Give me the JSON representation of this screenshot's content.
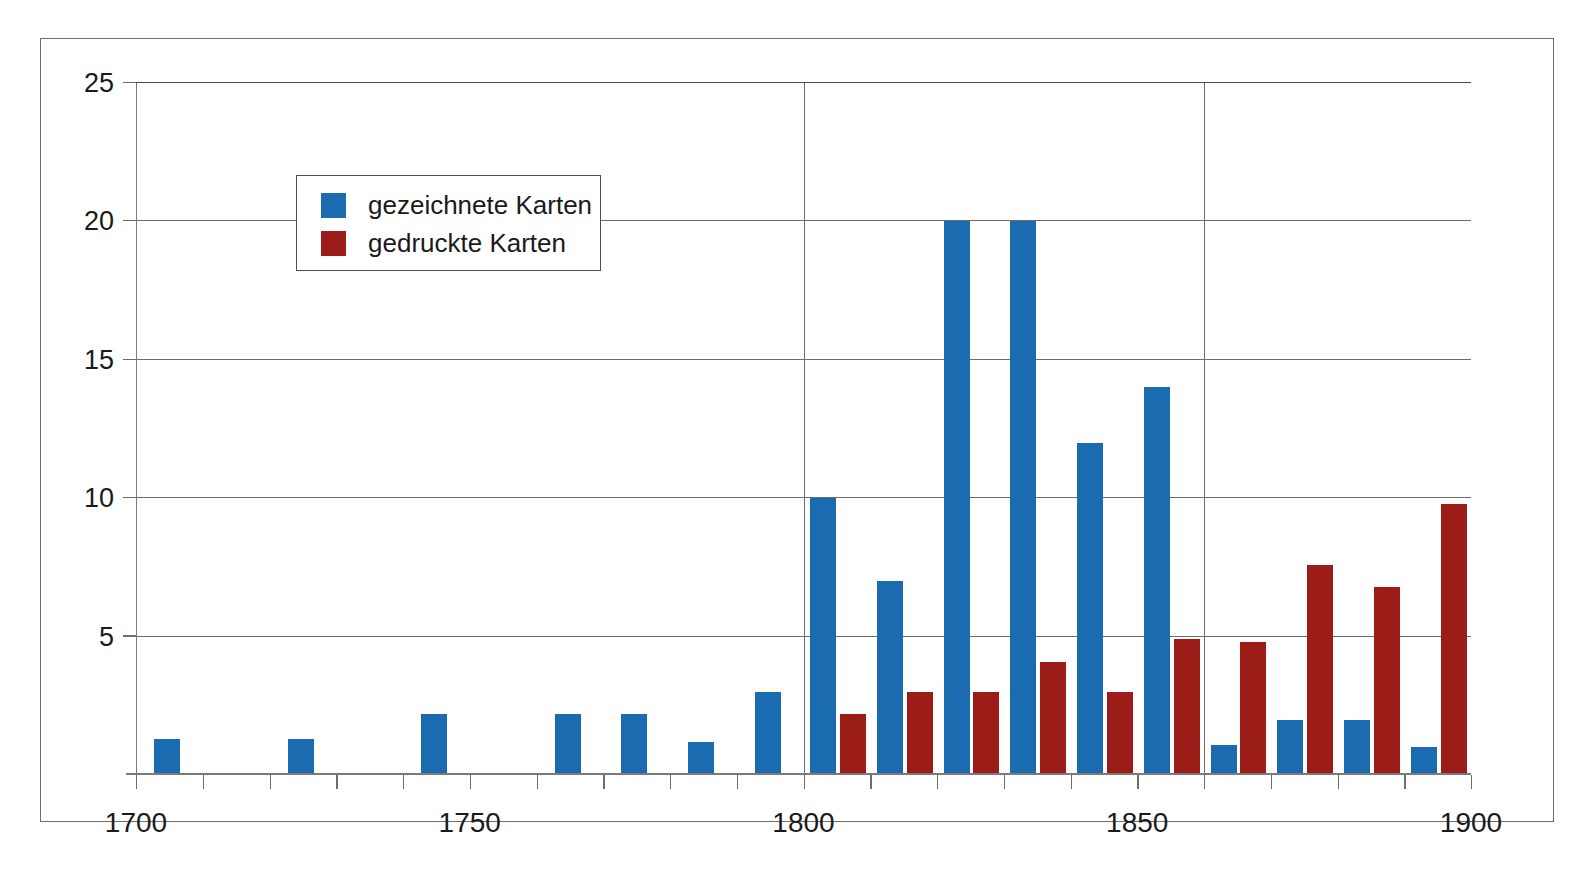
{
  "page": {
    "top_text_left": "",
    "top_text_right": ""
  },
  "legend": {
    "items": [
      {
        "label": "gezeichnete Karten",
        "color": "#1a6bb0",
        "key": "gezeichnete"
      },
      {
        "label": "gedruckte Karten",
        "color": "#9c1c18",
        "key": "gedruckte"
      }
    ]
  },
  "chart_data": {
    "type": "bar",
    "title": "",
    "xlabel": "",
    "ylabel": "",
    "xlim": [
      1700,
      1900
    ],
    "ylim": [
      0,
      25
    ],
    "yticks": [
      0,
      5,
      10,
      15,
      20,
      25
    ],
    "ytick_labels": [
      "",
      "5",
      "10",
      "15",
      "20",
      "25"
    ],
    "xticks": [
      1700,
      1710,
      1720,
      1730,
      1740,
      1750,
      1760,
      1770,
      1780,
      1790,
      1800,
      1810,
      1820,
      1830,
      1840,
      1850,
      1860,
      1870,
      1880,
      1890,
      1900
    ],
    "xtick_labels": [
      "1700",
      "1750",
      "1800",
      "1850",
      "1900"
    ],
    "xtick_label_values": [
      1700,
      1750,
      1800,
      1850,
      1900
    ],
    "vertical_gridlines": [
      1800,
      1860
    ],
    "grid": true,
    "legend_position": "top-left",
    "categories": [
      1700,
      1710,
      1720,
      1730,
      1740,
      1750,
      1760,
      1770,
      1780,
      1790,
      1800,
      1810,
      1820,
      1830,
      1840,
      1850,
      1860,
      1870,
      1880,
      1890
    ],
    "series": [
      {
        "name": "gezeichnete Karten",
        "color": "#1a6bb0",
        "values": [
          1.3,
          0,
          1.3,
          0,
          2.2,
          0,
          2.2,
          2.2,
          1.2,
          3.0,
          10,
          7,
          20,
          20,
          12,
          14,
          1.1,
          2.0,
          2.0,
          1.0
        ]
      },
      {
        "name": "gedruckte Karten",
        "color": "#9c1c18",
        "values": [
          0,
          0,
          0,
          0,
          0,
          0,
          0,
          0,
          0,
          0,
          2.2,
          3.0,
          3.0,
          4.1,
          3.0,
          4.9,
          4.8,
          7.6,
          6.8,
          9.8
        ]
      }
    ]
  },
  "colors": {
    "blue": "#1a6bb0",
    "red": "#9c1c18",
    "axis": "#6d6d6d",
    "frame": "#6f6f6f",
    "text": "#1a1a1a",
    "background": "#ffffff"
  }
}
